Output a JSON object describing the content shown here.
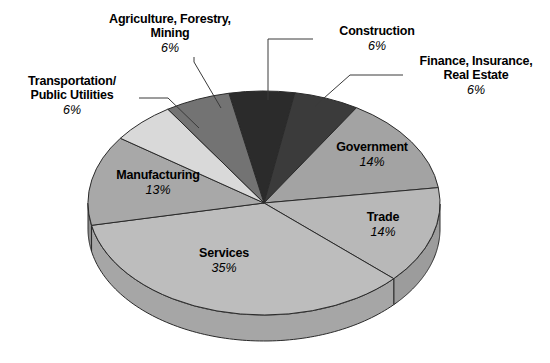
{
  "chart_data": {
    "type": "pie",
    "title": "",
    "subtitle": "",
    "xlabel": "",
    "ylabel": "",
    "legend_position": "none",
    "grid": false,
    "three_d": true,
    "categories": [
      "Construction",
      "Finance, Insurance, Real Estate",
      "Government",
      "Trade",
      "Services",
      "Manufacturing",
      "Transportation/ Public Utilities",
      "Agriculture, Forestry, Mining"
    ],
    "values": [
      6,
      6,
      14,
      14,
      35,
      13,
      6,
      6
    ],
    "units": "percent",
    "slices": [
      {
        "id": "construction",
        "label": "Construction",
        "label_lines": [
          "Construction"
        ],
        "percent_text": "6%",
        "value": 6,
        "color": "#2b2b2b",
        "side_color": "#1d1d1d",
        "label_placement": "callout"
      },
      {
        "id": "finance",
        "label": "Finance, Insurance, Real Estate",
        "label_lines": [
          "Finance, Insurance,",
          "Real Estate"
        ],
        "percent_text": "6%",
        "value": 6,
        "color": "#3b3b3b",
        "side_color": "#282828",
        "label_placement": "callout"
      },
      {
        "id": "government",
        "label": "Government",
        "label_lines": [
          "Government"
        ],
        "percent_text": "14%",
        "value": 14,
        "color": "#a3a3a3",
        "side_color": "#8a8a8a",
        "label_placement": "inside"
      },
      {
        "id": "trade",
        "label": "Trade",
        "label_lines": [
          "Trade"
        ],
        "percent_text": "14%",
        "value": 14,
        "color": "#b8b8b8",
        "side_color": "#9c9c9c",
        "label_placement": "inside"
      },
      {
        "id": "services",
        "label": "Services",
        "label_lines": [
          "Services"
        ],
        "percent_text": "35%",
        "value": 35,
        "color": "#bdbdbd",
        "side_color": "#a6a6a6",
        "label_placement": "inside"
      },
      {
        "id": "manufacturing",
        "label": "Manufacturing",
        "label_lines": [
          "Manufacturing"
        ],
        "percent_text": "13%",
        "value": 13,
        "color": "#a8a8a8",
        "side_color": "#909090",
        "label_placement": "inside"
      },
      {
        "id": "transportation",
        "label": "Transportation/ Public Utilities",
        "label_lines": [
          "Transportation/",
          "Public Utilities"
        ],
        "percent_text": "6%",
        "value": 6,
        "color": "#d9d9d9",
        "side_color": "#bcbcbc",
        "label_placement": "callout"
      },
      {
        "id": "agriculture",
        "label": "Agriculture, Forestry, Mining",
        "label_lines": [
          "Agriculture, Forestry,",
          "Mining"
        ],
        "percent_text": "6%",
        "value": 6,
        "color": "#737373",
        "side_color": "#5e5e5e",
        "label_placement": "callout"
      }
    ]
  },
  "labels": {
    "transportation": {
      "line1": "Transportation/",
      "line2": "Public Utilities",
      "percent": "6%"
    },
    "agriculture": {
      "line1": "Agriculture, Forestry,",
      "line2": "Mining",
      "percent": "6%"
    },
    "construction": {
      "line1": "Construction",
      "line2": "",
      "percent": "6%"
    },
    "finance": {
      "line1": "Finance, Insurance,",
      "line2": "Real Estate",
      "percent": "6%"
    },
    "government": {
      "line1": "Government",
      "percent": "14%"
    },
    "trade": {
      "line1": "Trade",
      "percent": "14%"
    },
    "services": {
      "line1": "Services",
      "percent": "35%"
    },
    "manufacturing": {
      "line1": "Manufacturing",
      "percent": "13%"
    }
  },
  "colors": {
    "background": "#ffffff",
    "outline": "#2a2a2a",
    "leader_line": "#3a3a3a",
    "text": "#000000"
  }
}
